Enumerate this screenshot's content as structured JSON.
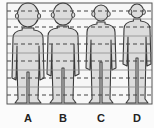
{
  "diagram": {
    "title": "",
    "colors": {
      "background": "#fbfbfb",
      "frame": "#555555",
      "grid_solid": "#8a8a8a",
      "grid_dashed": "#444444",
      "figure_fill": "#dcdcdc",
      "figure_stroke": "#3a3a3a",
      "label": "#222222"
    },
    "frame": {
      "x": 7,
      "y": 3,
      "width": 145,
      "height": 101
    },
    "grid": {
      "solid_lines_y": [
        19,
        36,
        53,
        70,
        87
      ],
      "dashed_lines_y": [
        11,
        27,
        44,
        61,
        78,
        95
      ]
    },
    "figures": [
      {
        "id": "A",
        "label": "A",
        "cx": 28,
        "head_top": 3,
        "head_bottom": 27,
        "head_half_width": 13,
        "shoulder_half_width": 15,
        "hip_half_width": 11,
        "foot_y": 103,
        "crotch_y": 72
      },
      {
        "id": "B",
        "label": "B",
        "cx": 63,
        "head_top": 3,
        "head_bottom": 25,
        "head_half_width": 12,
        "shoulder_half_width": 15,
        "hip_half_width": 11,
        "foot_y": 103,
        "crotch_y": 68
      },
      {
        "id": "C",
        "label": "C",
        "cx": 101,
        "head_top": 5,
        "head_bottom": 21,
        "head_half_width": 9,
        "shoulder_half_width": 14,
        "hip_half_width": 10,
        "foot_y": 103,
        "crotch_y": 62
      },
      {
        "id": "D",
        "label": "D",
        "cx": 137,
        "head_top": 4,
        "head_bottom": 18,
        "head_half_width": 8,
        "shoulder_half_width": 13,
        "hip_half_width": 9,
        "foot_y": 103,
        "crotch_y": 58
      }
    ]
  }
}
